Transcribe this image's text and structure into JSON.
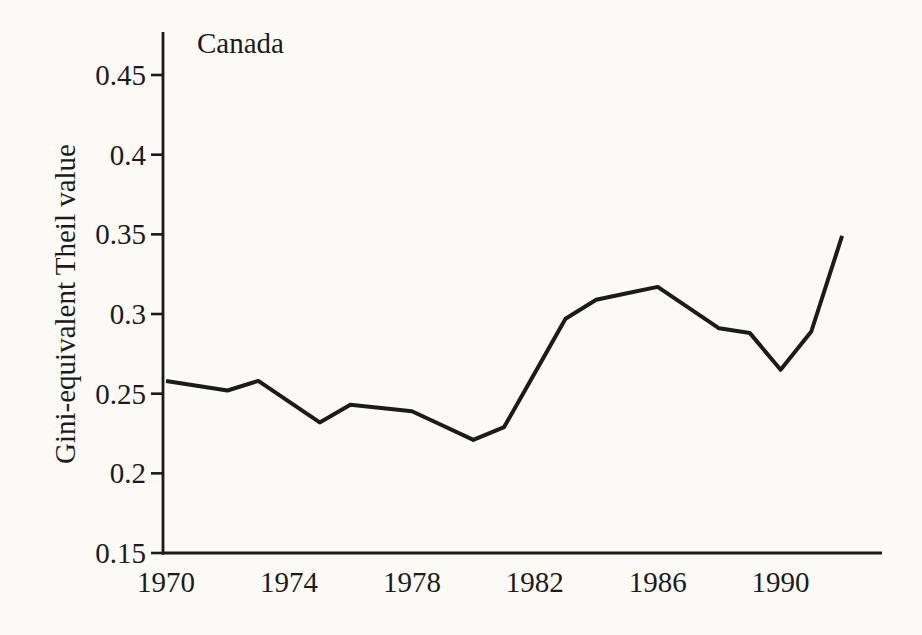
{
  "figure": {
    "background": "#fbfaf7",
    "ink": "#1b1b1b"
  },
  "chart_data": {
    "type": "line",
    "title": "Canada",
    "xlabel": "",
    "ylabel": "Gini-equivalent Theil value",
    "series_name": "Gini-equivalent Theil value",
    "x": [
      1970,
      1971,
      1972,
      1973,
      1974,
      1975,
      1976,
      1977,
      1978,
      1979,
      1980,
      1981,
      1982,
      1983,
      1984,
      1985,
      1986,
      1987,
      1988,
      1989,
      1990,
      1991,
      1992
    ],
    "values": [
      0.258,
      0.255,
      0.252,
      0.258,
      0.245,
      0.232,
      0.243,
      0.241,
      0.239,
      0.23,
      0.221,
      0.229,
      0.263,
      0.297,
      0.309,
      0.313,
      0.317,
      0.304,
      0.291,
      0.288,
      0.265,
      0.289,
      0.349
    ],
    "x_tick_values": [
      1970,
      1974,
      1978,
      1982,
      1986,
      1990
    ],
    "x_tick_labels": [
      "1970",
      "1974",
      "1978",
      "1982",
      "1986",
      "1990"
    ],
    "y_tick_values": [
      0.45,
      0.4,
      0.35,
      0.3,
      0.25,
      0.2,
      0.15
    ],
    "y_tick_labels": [
      "0.45",
      "0.4",
      "0.35",
      "0.3",
      "0.25",
      "0.2",
      "0.15"
    ],
    "xlim": [
      1969.9,
      1993.3
    ],
    "ylim": [
      0.15,
      0.477
    ],
    "grid": false,
    "legend": "none",
    "line_color": "#1b1b1b"
  }
}
